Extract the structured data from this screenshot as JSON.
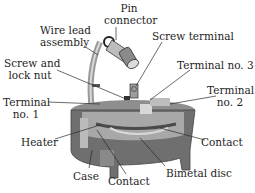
{
  "diagram": {
    "type": "labeled cutaway illustration",
    "colors": {
      "body": "#6f6f6f",
      "body_light": "#a8a8a8",
      "body_dark": "#4a4a4a",
      "highlight": "#d8d8d8",
      "leader": "#2a2a2a",
      "text": "#1e1e1e"
    },
    "labels": {
      "pin_connector_1": "Pin",
      "pin_connector_2": "connector",
      "wire_lead_1": "Wire lead",
      "wire_lead_2": "assembly",
      "screw_terminal": "Screw terminal",
      "screw_lock_1": "Screw and",
      "screw_lock_2": "lock nut",
      "terminal3": "Terminal no. 3",
      "terminal2_1": "Terminal",
      "terminal2_2": "no. 2",
      "terminal1_1": "Terminal",
      "terminal1_2": "no. 1",
      "heater": "Heater",
      "contact_right": "Contact",
      "case": "Case",
      "contact_bottom": "Contact",
      "bimetal_disc": "Bimetal disc"
    }
  }
}
